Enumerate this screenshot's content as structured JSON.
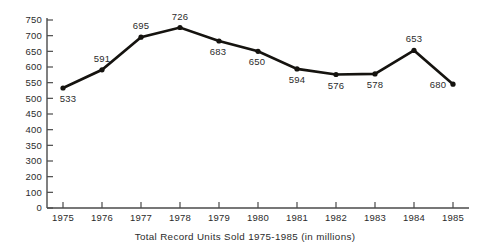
{
  "chart_data": {
    "type": "line",
    "title": "",
    "caption": "Total Record Units Sold 1975-1985 (in millions)",
    "xlabel": "Total Record Units Sold 1975-1985 (in millions)",
    "ylabel": "",
    "categories": [
      "1975",
      "1976",
      "1977",
      "1978",
      "1979",
      "1980",
      "1981",
      "1982",
      "1983",
      "1984",
      "1985"
    ],
    "values": [
      533,
      591,
      695,
      726,
      683,
      650,
      594,
      576,
      578,
      653,
      545
    ],
    "point_labels": [
      "533",
      "591",
      "695",
      "726",
      "683",
      "650",
      "594",
      "576",
      "578",
      "653",
      "680"
    ],
    "label_positions": [
      "below",
      "above",
      "above",
      "above",
      "below",
      "below",
      "below",
      "below",
      "below",
      "above",
      "below"
    ],
    "ytick_labels": [
      "750",
      "700",
      "650",
      "600",
      "550",
      "500",
      "450",
      "400",
      "350",
      "300",
      "200",
      "100",
      "0"
    ],
    "ylim": [
      0,
      750
    ],
    "grid": false,
    "legend": "none",
    "line_color": "#15130f",
    "axis_color": "#4a4a4a",
    "background_color": "#ffffff",
    "marker": "dot"
  }
}
